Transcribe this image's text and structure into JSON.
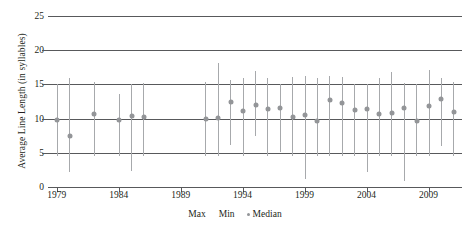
{
  "chart_data": {
    "type": "scatter",
    "title": "",
    "xlabel": "",
    "ylabel": "Average Line Length (in syllables)",
    "ylim": [
      0,
      25
    ],
    "yticks": [
      0,
      5,
      10,
      15,
      20,
      25
    ],
    "xlim": [
      1978.3,
      2011.7
    ],
    "xticks": [
      1979,
      1984,
      1989,
      1994,
      1999,
      2004,
      2009
    ],
    "grid": true,
    "legend_position": "bottom",
    "legend": [
      "Max",
      "Min",
      "Median"
    ],
    "series_names": [
      "Max",
      "Min",
      "Median"
    ],
    "x": [
      1979,
      1980,
      1982,
      1984,
      1985,
      1986,
      1991,
      1992,
      1993,
      1994,
      1995,
      1996,
      1997,
      1998,
      1999,
      2000,
      2001,
      2002,
      2003,
      2004,
      2005,
      2006,
      2007,
      2008,
      2009,
      2010,
      2011
    ],
    "series": [
      {
        "name": "Max",
        "values": [
          15.0,
          15.9,
          15.3,
          13.6,
          15.1,
          15.2,
          15.3,
          18.2,
          15.7,
          15.9,
          16.9,
          15.9,
          15.1,
          16.1,
          16.3,
          15.9,
          16.2,
          16.1,
          15.1,
          15.0,
          15.9,
          16.8,
          15.2,
          15.1,
          17.1,
          15.9,
          15.3
        ]
      },
      {
        "name": "Min",
        "values": [
          4.5,
          2.2,
          4.6,
          4.6,
          2.3,
          4.6,
          4.6,
          4.6,
          6.1,
          4.6,
          7.5,
          4.6,
          5.1,
          4.6,
          1.2,
          4.6,
          4.6,
          4.6,
          4.6,
          2.2,
          4.6,
          4.6,
          0.9,
          4.6,
          4.6,
          6.0,
          4.6
        ]
      },
      {
        "name": "Median",
        "values": [
          9.8,
          7.4,
          10.7,
          9.8,
          10.4,
          10.2,
          10.0,
          10.1,
          12.4,
          11.1,
          12.0,
          11.4,
          11.6,
          10.3,
          10.5,
          9.6,
          12.7,
          12.3,
          11.2,
          11.4,
          10.6,
          10.8,
          11.6,
          9.7,
          11.8,
          12.9,
          10.9
        ]
      }
    ]
  }
}
